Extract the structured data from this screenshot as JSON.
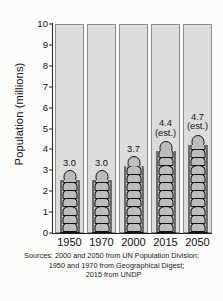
{
  "chart_data": {
    "type": "bar",
    "title": "",
    "subtitle": "",
    "xlabel": "",
    "ylabel": "Population (millions)",
    "categories": [
      "1950",
      "1970",
      "2000",
      "2015",
      "2050"
    ],
    "values": [
      3.0,
      3.0,
      3.7,
      4.4,
      4.7
    ],
    "value_labels": [
      "3.0",
      "3.0",
      "3.7",
      "4.4",
      "4.7"
    ],
    "estimate_flags": [
      "",
      "",
      "",
      "(est.)",
      "(est.)"
    ],
    "ylim": [
      0,
      10
    ],
    "yticks": [
      "0",
      "1",
      "2",
      "3",
      "4",
      "5",
      "6",
      "7",
      "8",
      "9",
      "10"
    ],
    "grid": false,
    "legend": "none",
    "units": "millions",
    "bar_style": "stacked-person-icons",
    "colors": {
      "background": "#fbfbfa",
      "column_fill": "#dcdcdc",
      "column_border": "#8a8a8a",
      "bar_fill": "#bdbdbd",
      "bar_outline": "#111111",
      "axis": "#222222",
      "text": "#141414"
    }
  },
  "sources": {
    "line1": "Sources: 2000 and 2050 from UN Population Division;",
    "line2": "1950 and 1970 from Geographical Digest;",
    "line3": "2015 from UNDP"
  }
}
